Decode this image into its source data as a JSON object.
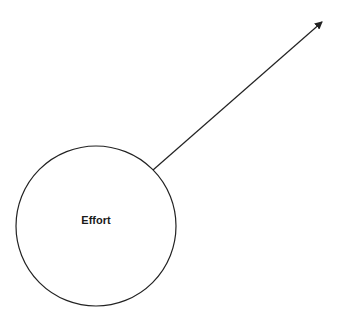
{
  "diagram": {
    "node": {
      "label": "Effort",
      "cx": 96,
      "cy": 226,
      "r": 80
    },
    "arrow": {
      "x1": 153,
      "y1": 170,
      "x2": 323,
      "y2": 21
    },
    "stroke_color": "#222222"
  }
}
